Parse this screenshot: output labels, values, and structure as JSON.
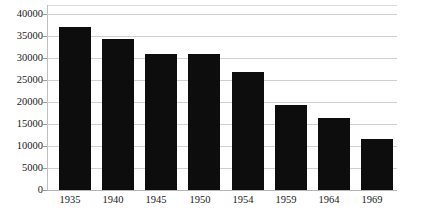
{
  "chart_data": {
    "type": "bar",
    "title": "",
    "subtitle": "",
    "xlabel": "",
    "ylabel": "",
    "categories": [
      "1935",
      "1940",
      "1945",
      "1950",
      "1954",
      "1959",
      "1964",
      "1969"
    ],
    "values": [
      37000,
      34300,
      31000,
      30800,
      26900,
      19300,
      16400,
      11500
    ],
    "series": [
      {
        "name": "",
        "values": [
          37000,
          34300,
          31000,
          30800,
          26900,
          19300,
          16400,
          11500
        ]
      }
    ],
    "ylim": [
      0,
      40000
    ],
    "ytick_labels": [
      "0",
      "5000",
      "10000",
      "15000",
      "20000",
      "25000",
      "30000",
      "35000",
      "40000"
    ],
    "ytick_values": [
      0,
      5000,
      10000,
      15000,
      20000,
      25000,
      30000,
      35000,
      40000
    ],
    "xtick_labels": [
      "1935",
      "1940",
      "1945",
      "1950",
      "1954",
      "1959",
      "1964",
      "1969"
    ],
    "grid": true,
    "grid_axis": "y",
    "legend": false,
    "legend_position": "none",
    "bar_color": "#0d0d0d",
    "gridline_color": "#d0d0d0",
    "background_color": "#ffffff",
    "annotations": []
  }
}
